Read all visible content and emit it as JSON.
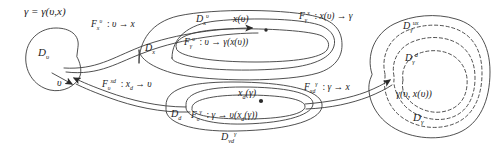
{
  "figure": {
    "type": "commutative-mapping-diagram",
    "title_equation": "γ = γ(υ, x)",
    "background": "#ffffff",
    "stroke": "#3a3a3a",
    "width": 499,
    "height": 167
  },
  "domains": {
    "v_domain": "𝒟ᵥ",
    "v_element": "υ",
    "x_domain": "𝒟ₓ",
    "x_v_domain": "𝒟ₓᵛ",
    "x_of_v": "x(υ)",
    "d_domain": "𝒟_d",
    "vd_gamma_domain": "𝒟_vd^γ",
    "xd_of_gamma": "x_d(γ)",
    "gamma_ux_domain": "𝒟_γ^{ux}",
    "gamma_d_domain": "𝒟_γ^d",
    "gamma_domain": "𝒟_γ",
    "gamma_of_v_xv": "γ(υ, x(υ))"
  },
  "maps": {
    "F_x_v": "ℱₓᵛ : υ → x",
    "F_gamma_v": "ℱᵧᵛ : υ → γ(x(υ))",
    "F_gamma_x": "ℱᵧˣ : x(υ) → γ",
    "F_v_xd": "ℱᵥˣᵈ : x_d → υ",
    "F_v_gamma": "ℱᵥᵧ : γ → υ(x_d(γ))",
    "F_xd_gamma": "ℱₓᵈᵧ : γ → x"
  },
  "labels": [
    {
      "id": "title-eq",
      "text": "γ = γ(υ,x)",
      "x": 24,
      "y": 8,
      "size": 11
    },
    {
      "id": "dv",
      "text": "𝒟ᵥ",
      "x": 38,
      "y": 52,
      "size": 11
    },
    {
      "id": "v-elem",
      "text": "υ",
      "x": 57,
      "y": 83,
      "size": 10
    },
    {
      "id": "f-x-v",
      "text": "ℱₓᵛ : υ → x",
      "x": 92,
      "y": 23,
      "size": 10
    },
    {
      "id": "dx",
      "text": "𝒟ₓ",
      "x": 146,
      "y": 46,
      "size": 10
    },
    {
      "id": "dx-v",
      "text": "𝒟ₓᵛ",
      "x": 196,
      "y": 16,
      "size": 10
    },
    {
      "id": "x-of-v",
      "text": "x(υ)",
      "x": 234,
      "y": 17,
      "size": 10
    },
    {
      "id": "f-gamma-v",
      "text": "ℱᵧᵛ : υ → γ(x(υ))",
      "x": 185,
      "y": 40,
      "size": 10
    },
    {
      "id": "f-gamma-x",
      "text": "ℱᵧˣ : x(υ) → γ",
      "x": 300,
      "y": 14,
      "size": 10
    },
    {
      "id": "d-gamma-ux",
      "text": "𝒟ᵧ^{ux}",
      "x": 404,
      "y": 23,
      "size": 10
    },
    {
      "id": "d-gamma-d",
      "text": "𝒟ᵧ^{d}",
      "x": 406,
      "y": 55,
      "size": 10
    },
    {
      "id": "f-v-xd",
      "text": "ℱᵥ^{xd} : x_d → υ",
      "x": 103,
      "y": 82,
      "size": 10
    },
    {
      "id": "dd",
      "text": "𝒟_d",
      "x": 172,
      "y": 113,
      "size": 10
    },
    {
      "id": "xd-of-gamma",
      "text": "x_d(γ)",
      "x": 220,
      "y": 93,
      "size": 10
    },
    {
      "id": "f-v-gamma",
      "text": "ℱᵥ^{γ} : γ → υ(x_d(γ))",
      "x": 192,
      "y": 113,
      "size": 10
    },
    {
      "id": "d-vd-gamma",
      "text": "𝒟_{vd}^{γ}",
      "x": 222,
      "y": 135,
      "size": 10
    },
    {
      "id": "f-xd-gamma",
      "text": "ℱ_{xd}^{γ} : γ → x",
      "x": 305,
      "y": 85,
      "size": 10
    },
    {
      "id": "gamma-of-v-xv",
      "text": "γ(υ, x(υ))",
      "x": 396,
      "y": 92,
      "size": 10
    },
    {
      "id": "d-gamma",
      "text": "𝒟ᵧ",
      "x": 414,
      "y": 116,
      "size": 11
    }
  ],
  "shapes": {
    "left_blob": "irregular closed curve around D_v",
    "middle_stack": "three nested lens/ellipse outlines containing D_x, D_x^v, x(v)",
    "bottom_stack": "nested ellipses containing D_d, D_vd^gamma, x_d(gamma)",
    "right_blob": "large irregular closed curve with two nested dashed contours D_gamma^ux and D_gamma^d"
  },
  "arrows": {
    "top": "curve from D_v rightwards to x(v) with arrowhead",
    "bottom_left": "curve from D_d leftwards into D_v with arrowhead",
    "bottom_right": "curve from D_d rightwards to gamma(v,x(v)) with arrowhead"
  }
}
